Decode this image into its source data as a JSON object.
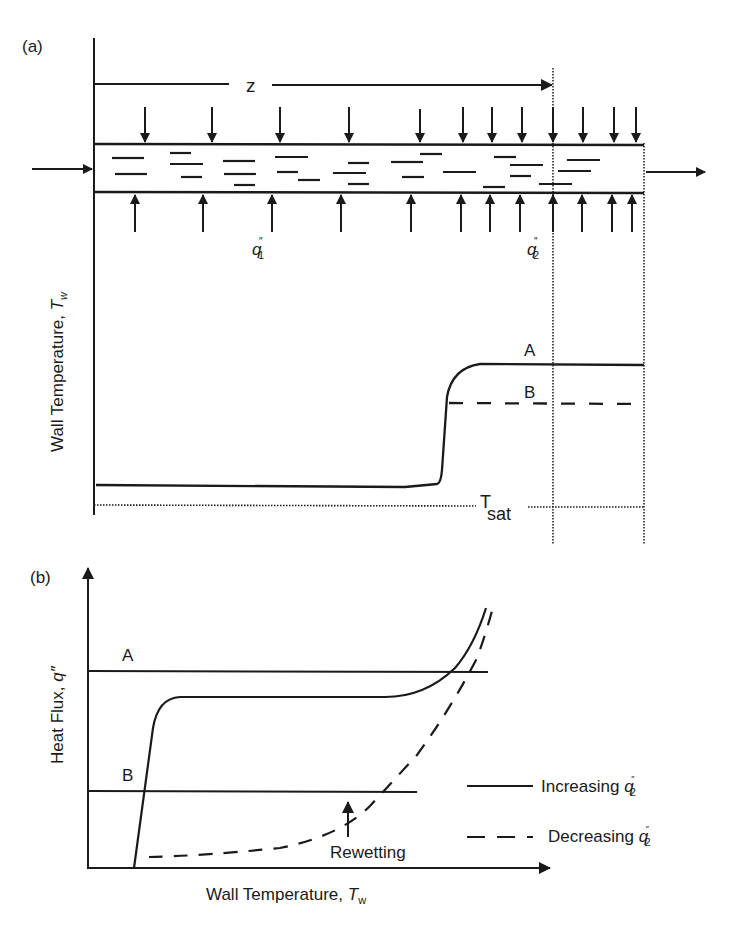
{
  "panel_a": {
    "label": "(a)",
    "z_label": "z",
    "q1_label": "q",
    "q1_sup": "″",
    "q1_sub": "1",
    "q2_label": "q",
    "q2_sup": "″",
    "q2_sub": "2",
    "y_axis_label": "Wall Temperature, ",
    "y_axis_var": "T",
    "y_axis_sub": "w",
    "curve_a_label": "A",
    "curve_b_label": "B",
    "tsat_label": "T",
    "tsat_sub": "sat"
  },
  "panel_b": {
    "label": "(b)",
    "line_a_label": "A",
    "line_b_label": "B",
    "y_axis_label": "Heat Flux, ",
    "y_axis_var": "q″",
    "x_axis_label": "Wall Temperature, ",
    "x_axis_var": "T",
    "x_axis_sub": "w",
    "annotation": "Rewetting",
    "legend": [
      {
        "label": "Increasing ",
        "var": "q",
        "sup": "″",
        "sub": "2",
        "style": "solid"
      },
      {
        "label": "Decreasing ",
        "var": "q",
        "sup": "″",
        "sub": "2",
        "style": "dashed"
      }
    ]
  },
  "colors": {
    "ink": "#1a1a1a",
    "background": "#ffffff"
  }
}
